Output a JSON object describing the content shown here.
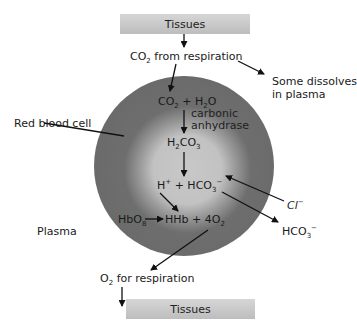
{
  "diagram": {
    "top_box": {
      "label": "Tissues"
    },
    "bottom_box": {
      "label": "Tissues"
    },
    "co2_source": {
      "prefix": "CO",
      "sub": "2",
      "suffix": " from respiration"
    },
    "plasma_dissolve": {
      "line1": "Some dissolves",
      "line2": "in plasma"
    },
    "red_blood_cell_label": "Red blood cell",
    "plasma_label": "Plasma",
    "reaction1": {
      "a": "CO",
      "a_sub": "2",
      "plus": " + H",
      "b_sub": "2",
      "b": "O"
    },
    "enzyme": {
      "line1": "carbonic",
      "line2": "anhydrase"
    },
    "reaction2": {
      "a": "H",
      "a_sub": "2",
      "b": "CO",
      "b_sub": "3"
    },
    "reaction3": {
      "h": "H",
      "h_sup": "+",
      "plus": " + HCO",
      "sub": "3",
      "sup": "−"
    },
    "chloride": {
      "text": "Cl",
      "sup": "−"
    },
    "bicarbonate_out": {
      "text": "HCO",
      "sub": "3",
      "sup": "−"
    },
    "hb_reaction": {
      "a": "HbO",
      "a_sub": "8",
      "b": "HHb + 4O",
      "b_sub": "2"
    },
    "o2_out": {
      "prefix": "O",
      "sub": "2",
      "suffix": " for respiration"
    },
    "colors": {
      "cell_outer": "#666666",
      "cell_inner": "#c8c8c8",
      "bar_top": "#d6d6d6",
      "bar_bottom": "#bdbdbd",
      "arrow": "#111111"
    }
  }
}
